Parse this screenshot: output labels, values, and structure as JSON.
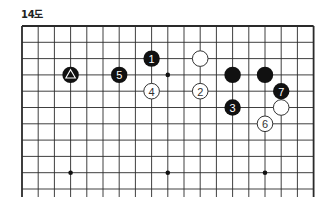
{
  "diagram": {
    "title": "14도",
    "board": {
      "columns": 19,
      "visible_rows": 11,
      "origin_x": 22,
      "origin_y": 26,
      "spacing_x": 16.2,
      "spacing_y": 16.3,
      "line_extend_bottom": 8,
      "line_color": "#2a2a2a",
      "edges": [
        "top",
        "left",
        "right"
      ]
    },
    "hoshi": [
      {
        "col": 9,
        "row": 3
      },
      {
        "col": 3,
        "row": 9
      },
      {
        "col": 9,
        "row": 9
      },
      {
        "col": 15,
        "row": 9
      }
    ],
    "stones": [
      {
        "color": "black",
        "col": 3,
        "row": 3,
        "mark": "triangle",
        "label": ""
      },
      {
        "color": "black",
        "col": 6,
        "row": 3,
        "mark": "number",
        "label": "5"
      },
      {
        "color": "black",
        "col": 8,
        "row": 2,
        "mark": "number",
        "label": "1"
      },
      {
        "color": "white",
        "col": 11,
        "row": 2,
        "mark": "none",
        "label": ""
      },
      {
        "color": "white",
        "col": 8,
        "row": 4,
        "mark": "number",
        "label": "4"
      },
      {
        "color": "white",
        "col": 11,
        "row": 4,
        "mark": "number",
        "label": "2"
      },
      {
        "color": "black",
        "col": 13,
        "row": 3,
        "mark": "none",
        "label": ""
      },
      {
        "color": "black",
        "col": 15,
        "row": 3,
        "mark": "none",
        "label": ""
      },
      {
        "color": "black",
        "col": 13,
        "row": 5,
        "mark": "number",
        "label": "3"
      },
      {
        "color": "black",
        "col": 16,
        "row": 4,
        "mark": "number",
        "label": "7"
      },
      {
        "color": "white",
        "col": 16,
        "row": 5,
        "mark": "none",
        "label": ""
      },
      {
        "color": "white",
        "col": 15,
        "row": 6,
        "mark": "number",
        "label": "6"
      }
    ],
    "colors": {
      "black_stone": "#111111",
      "white_stone": "#ffffff",
      "white_stone_border": "#333333",
      "black_label": "#ffffff",
      "white_label": "#333333"
    }
  }
}
